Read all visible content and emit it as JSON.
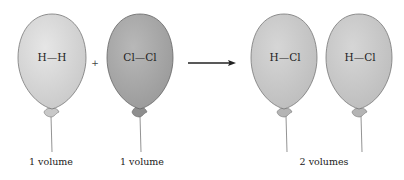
{
  "figure": {
    "reactants": [
      {
        "molecule": "H—H",
        "volume_label": "1 volume",
        "fill": "#d4d4d4"
      },
      {
        "molecule": "Cl—Cl",
        "volume_label": "1 volume",
        "fill": "#a9a9a9"
      }
    ],
    "operator": "+",
    "arrow": "reaction-arrow",
    "products": [
      {
        "molecule": "H—Cl",
        "fill": "#c4c4c4"
      },
      {
        "molecule": "H—Cl",
        "fill": "#c4c4c4"
      }
    ],
    "products_volume_label": "2 volumes"
  }
}
